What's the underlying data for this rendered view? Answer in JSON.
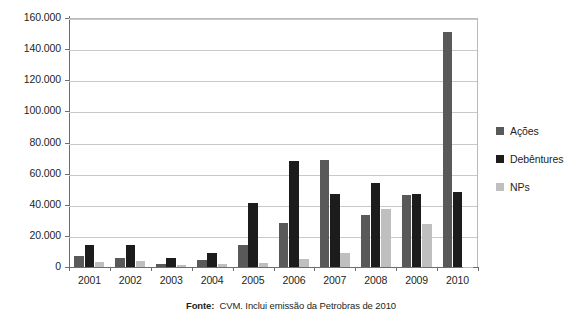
{
  "chart_data": {
    "type": "bar",
    "title": "",
    "xlabel": "",
    "ylabel": "",
    "categories": [
      "2001",
      "2002",
      "2003",
      "2004",
      "2005",
      "2006",
      "2007",
      "2008",
      "2009",
      "2010"
    ],
    "series": [
      {
        "name": "Ações",
        "color": "#595959",
        "values": [
          7000,
          6000,
          2000,
          4500,
          14000,
          28000,
          69000,
          33500,
          46000,
          151000
        ]
      },
      {
        "name": "Debêntures",
        "color": "#1c1c1c",
        "values": [
          14000,
          14000,
          5500,
          9000,
          41000,
          68000,
          47000,
          54000,
          47000,
          48000
        ]
      },
      {
        "name": "NPs",
        "color": "#bfbfbf",
        "values": [
          3000,
          4000,
          1500,
          2000,
          2500,
          5000,
          9000,
          37500,
          27500,
          300
        ]
      }
    ],
    "ylim": [
      0,
      160000
    ],
    "ytick_values": [
      0,
      20000,
      40000,
      60000,
      80000,
      100000,
      120000,
      140000,
      160000
    ],
    "ytick_labels": [
      "0",
      "20.000",
      "40.000",
      "60.000",
      "80.000",
      "100.000",
      "120.000",
      "140.000",
      "160.000"
    ],
    "grid": true,
    "legend_position": "right"
  },
  "legend": {
    "items": [
      {
        "label": "Ações"
      },
      {
        "label": "Debêntures"
      },
      {
        "label": "NPs"
      }
    ]
  },
  "source": {
    "prefix": "Fonte:",
    "text": "CVM. Inclui emissão da Petrobras de 2010"
  }
}
